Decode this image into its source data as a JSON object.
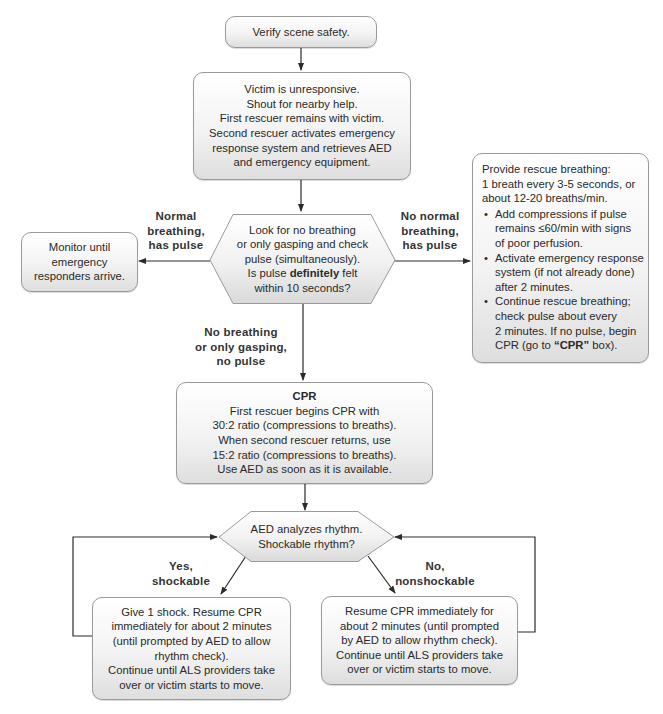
{
  "flowchart": {
    "start": {
      "text": "Verify scene safety."
    },
    "unresponsive": {
      "lines": [
        "Victim is unresponsive.",
        "Shout for nearby help.",
        "First rescuer remains with victim.",
        "Second rescuer activates emergency",
        "response system and retrieves AED",
        "and emergency equipment."
      ]
    },
    "check_decision": {
      "lines": [
        "Look for no breathing",
        "or only gasping and check",
        "pulse (simultaneously)."
      ],
      "line4_pre": "Is pulse ",
      "line4_bold": "definitely",
      "line4_post": " felt",
      "line5": "within 10 seconds?"
    },
    "monitor": {
      "lines": [
        "Monitor until",
        "emergency",
        "responders arrive."
      ]
    },
    "rescue_breathing": {
      "intro": [
        "Provide rescue breathing:",
        "1 breath every 3-5 seconds, or",
        "about 12-20 breaths/min."
      ],
      "bullets": [
        [
          "Add compressions if pulse",
          "remains ≤60/min with signs",
          "of poor perfusion."
        ],
        [
          "Activate emergency response",
          "system (if not already done)",
          "after 2 minutes."
        ],
        [
          "Continue rescue breathing;",
          "check pulse about every",
          "2 minutes. If no pulse, begin"
        ]
      ],
      "last_pre": "CPR (go to ",
      "last_bold": "“CPR”",
      "last_post": " box)."
    },
    "cpr": {
      "title": "CPR",
      "lines": [
        "First rescuer begins CPR with",
        "30:2 ratio (compressions to breaths).",
        "When second rescuer returns, use",
        "15:2 ratio (compressions to breaths).",
        "Use AED as soon as it is available."
      ]
    },
    "aed_decision": {
      "lines": [
        "AED analyzes rhythm.",
        "Shockable rhythm?"
      ]
    },
    "shock": {
      "lines": [
        "Give 1 shock. Resume CPR",
        "immediately for about 2 minutes",
        "(until prompted by AED to allow",
        "rhythm check).",
        "Continue until ALS providers take",
        "over or victim starts to move."
      ]
    },
    "no_shock": {
      "lines": [
        "Resume CPR immediately for",
        "about 2 minutes (until prompted",
        "by AED to allow rhythm check).",
        "Continue until ALS providers take",
        "over or victim starts to move."
      ]
    },
    "edge_labels": {
      "normal_breathing": [
        "Normal",
        "breathing,",
        "has pulse"
      ],
      "no_normal_breathing": [
        "No normal",
        "breathing,",
        "has pulse"
      ],
      "no_breathing": [
        "No breathing",
        "or only gasping,",
        "no pulse"
      ],
      "shockable": [
        "Yes,",
        "shockable"
      ],
      "nonshockable": [
        "No,",
        "nonshockable"
      ]
    }
  },
  "colors": {
    "line": "#2b2b2b",
    "box_border": "#9a9a9a",
    "box_fill_top": "#ffffff",
    "box_fill_bottom": "#dedede"
  }
}
